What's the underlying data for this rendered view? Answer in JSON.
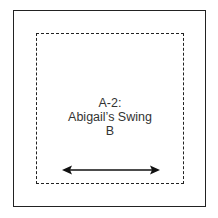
{
  "block": {
    "code": "A-2:",
    "name": "Abigail’s Swing",
    "fabric": "B"
  },
  "grainline": {
    "direction": "horizontal",
    "icon": "double-arrow-icon"
  },
  "colors": {
    "line": "#222222",
    "text": "#333333",
    "background": "#ffffff"
  }
}
